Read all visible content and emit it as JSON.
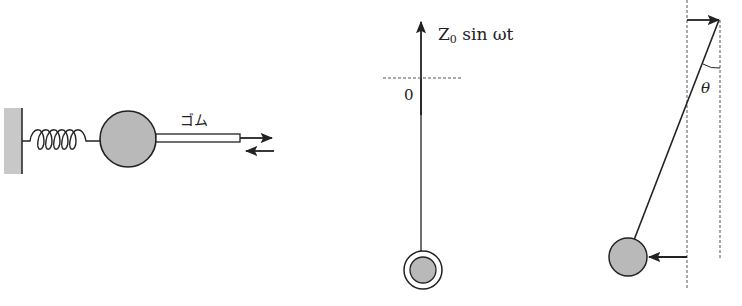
{
  "figures": [
    {
      "id": "spring-mass-rubber",
      "labels": {
        "rubber": "ゴム"
      }
    },
    {
      "id": "vertical-driven-pendulum",
      "labels": {
        "drive_Z": "Z",
        "drive_sub": "0",
        "drive_rest": " sin ωt",
        "origin": "0"
      }
    },
    {
      "id": "horizontal-driven-pendulum",
      "labels": {
        "angle": "θ"
      }
    }
  ],
  "colors": {
    "ink": "#222222",
    "mass_fill": "#b9b9b9",
    "wall_fill": "#c8c8c8",
    "dash": "#555555"
  }
}
